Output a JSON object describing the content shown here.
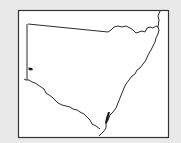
{
  "map": {
    "region": "New South Wales",
    "colors": {
      "background": "#e9e9e9",
      "frame_fill": "#ffffff",
      "outline": "#2a2a2a",
      "highlight": "#1a1a1a"
    },
    "highlighted_areas": [
      {
        "name": "western-marker",
        "x": 30,
        "y": 69
      },
      {
        "name": "south-east-coast-marker",
        "x": 107,
        "y": 118
      }
    ]
  }
}
